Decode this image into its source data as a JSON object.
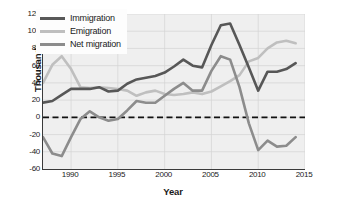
{
  "chart_data": {
    "type": "line",
    "title": "",
    "xlabel": "Year",
    "ylabel": "Thousands",
    "xlim": [
      1987,
      2015
    ],
    "ylim": [
      -60,
      120
    ],
    "ytick_values": [
      120,
      100,
      80,
      60,
      40,
      20,
      0,
      -20,
      -40,
      -60
    ],
    "ytick_labels": [
      "120",
      "100",
      "80",
      "60",
      "40",
      "20",
      "0",
      "-20",
      "-40",
      "-60"
    ],
    "xtick_values": [
      1990,
      1995,
      2000,
      2005,
      2010,
      2015
    ],
    "xtick_labels": [
      "1990",
      "1995",
      "2000",
      "2005",
      "2010",
      "2015"
    ],
    "grid": true,
    "legend_position": "upper-left-inside",
    "zero_line": {
      "value": 0,
      "style": "dashed",
      "color": "#111111"
    },
    "x": [
      1987,
      1988,
      1989,
      1990,
      1991,
      1992,
      1993,
      1994,
      1995,
      1996,
      1997,
      1998,
      1999,
      2000,
      2001,
      2002,
      2003,
      2004,
      2005,
      2006,
      2007,
      2008,
      2009,
      2010,
      2011,
      2012,
      2013,
      2014
    ],
    "series": [
      {
        "name": "Immigration",
        "color": "#575757",
        "values": [
          17,
          19,
          26,
          33,
          33,
          33,
          35,
          30,
          31,
          39,
          44,
          46,
          48,
          52,
          59,
          67,
          60,
          58,
          84,
          107,
          109,
          84,
          58,
          31,
          53,
          53,
          56,
          63
        ]
      },
      {
        "name": "Emigration",
        "color": "#bfbfbf",
        "values": [
          40,
          61,
          71,
          56,
          35,
          34,
          35,
          34,
          33,
          31,
          25,
          29,
          31,
          27,
          26,
          27,
          29,
          27,
          30,
          36,
          42,
          49,
          65,
          69,
          80,
          87,
          89,
          86
        ]
      },
      {
        "name": "Net migration",
        "color": "#8c8c8c",
        "values": [
          -23,
          -42,
          -45,
          -23,
          -2,
          7,
          0,
          -4,
          -2,
          8,
          19,
          17,
          17,
          25,
          33,
          40,
          31,
          31,
          54,
          71,
          67,
          35,
          -7,
          -38,
          -27,
          -34,
          -33,
          -23
        ]
      }
    ]
  },
  "legend": {
    "items": [
      {
        "label": "Immigration",
        "color": "#575757"
      },
      {
        "label": "Emigration",
        "color": "#bfbfbf"
      },
      {
        "label": "Net migration",
        "color": "#8c8c8c"
      }
    ]
  }
}
